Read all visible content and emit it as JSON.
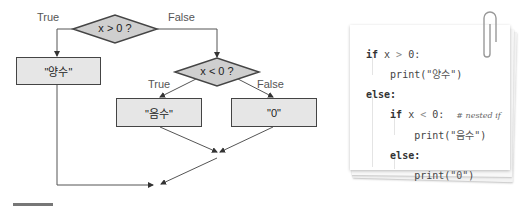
{
  "flowchart": {
    "decision_outer": {
      "label": "x > 0 ?",
      "true_label": "True",
      "false_label": "False"
    },
    "decision_inner": {
      "label": "x < 0 ?",
      "true_label": "True",
      "false_label": "False"
    },
    "box_positive": "\"양수\"",
    "box_negative": "\"음수\"",
    "box_zero": "\"0\"",
    "colors": {
      "node_fill": "#e6e6e6",
      "diamond_fill": "#cfcfcf",
      "stroke": "#444444",
      "edge": "#555555"
    }
  },
  "code_card": {
    "lines": [
      {
        "kw": "if",
        "rest": " x ",
        "op": ">",
        "tail": " 0:"
      },
      {
        "fn": "print(",
        "str": "\"양수\"",
        "close": ")"
      },
      {
        "kw": "else:"
      },
      {
        "kw": "if",
        "rest": " x ",
        "op": "<",
        "tail": " 0:",
        "comment": "# nested if"
      },
      {
        "fn": "print(",
        "str": "\"음수\"",
        "close": ")"
      },
      {
        "kw": "else:"
      },
      {
        "fn": "print(",
        "str": "\"0\"",
        "close": ")"
      }
    ]
  }
}
